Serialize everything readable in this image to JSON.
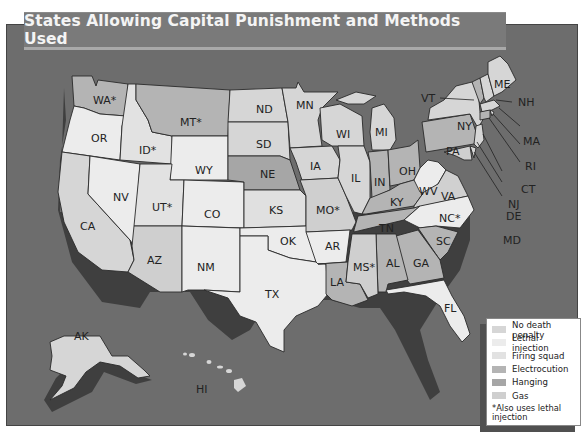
{
  "title": "States Allowing Capital Punishment and Methods Used",
  "colors": {
    "background": "#6d6d6d",
    "shadow": "#3f3f3f",
    "no_death_penalty": "#d6d6d6",
    "lethal_injection": "#ececec",
    "firing_squad": "#e2e2e2",
    "electrocution": "#b4b4b4",
    "hanging": "#a6a6a6",
    "gas": "#cfcfcf"
  },
  "legend": {
    "items": [
      {
        "label": "No death penalty",
        "key": "no_death_penalty"
      },
      {
        "label": "Lethal injection",
        "key": "lethal_injection"
      },
      {
        "label": "Firing squad",
        "key": "firing_squad"
      },
      {
        "label": "Electrocution",
        "key": "electrocution"
      },
      {
        "label": "Hanging",
        "key": "hanging"
      },
      {
        "label": "Gas",
        "key": "gas"
      }
    ],
    "note": "*Also uses lethal injection"
  },
  "states": {
    "WA": "WA*",
    "OR": "OR",
    "CA": "CA",
    "ID": "ID*",
    "NV": "NV",
    "MT": "MT*",
    "WY": "WY",
    "UT": "UT*",
    "AZ": "AZ",
    "CO": "CO",
    "NM": "NM",
    "ND": "ND",
    "SD": "SD",
    "NE": "NE",
    "KS": "KS",
    "OK": "OK",
    "TX": "TX",
    "MN": "MN",
    "IA": "IA",
    "MO": "MO*",
    "AR": "AR",
    "LA": "LA",
    "WI": "WI",
    "IL": "IL",
    "MI": "MI",
    "IN": "IN",
    "OH": "OH",
    "KY": "KY",
    "TN": "TN",
    "MS": "MS*",
    "AL": "AL",
    "GA": "GA",
    "FL": "FL",
    "SC": "SC",
    "NC": "NC*",
    "VA": "VA",
    "WV": "WV",
    "PA": "PA",
    "NY": "NY",
    "VT": "VT",
    "NH": "NH",
    "ME": "ME",
    "MA": "MA",
    "RI": "RI",
    "CT": "CT",
    "NJ": "NJ",
    "DE": "DE",
    "MD": "MD",
    "AK": "AK",
    "HI": "HI"
  }
}
